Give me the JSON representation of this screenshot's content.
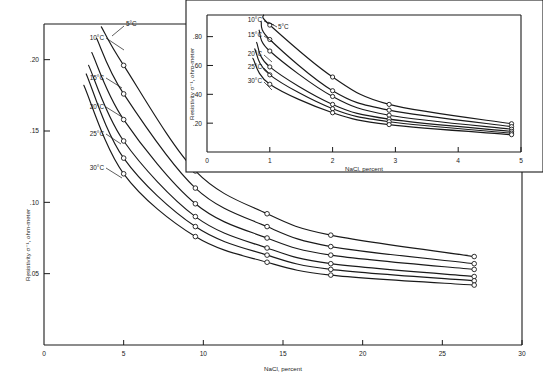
{
  "figure": {
    "background": "#ffffff",
    "ink_color": "#1a1a1a",
    "marker_style": "open-circle"
  },
  "chart_data": [
    {
      "id": "main",
      "type": "line",
      "title": "",
      "xlabel": "NaCl, percent",
      "ylabel": "Resistivity σ⁻¹, ohm-meter",
      "xlim": [
        0,
        30
      ],
      "ylim": [
        0,
        0.225
      ],
      "xticks": [
        0,
        5,
        10,
        15,
        20,
        25,
        30
      ],
      "xticklabels": [
        "0",
        "5",
        "10",
        "15",
        "20",
        "25",
        "30"
      ],
      "yticks": [
        0.05,
        0.1,
        0.15,
        0.2
      ],
      "yticklabels": [
        ".05",
        ".10",
        ".15",
        ".20"
      ],
      "grid": false,
      "legend_position": "inline-curve-labels",
      "x": [
        5,
        9.5,
        14,
        18,
        27
      ],
      "series": [
        {
          "name": "5°C",
          "label": "5°C",
          "values": [
            0.196,
            0.122,
            0.092,
            0.077,
            0.062
          ]
        },
        {
          "name": "10°C",
          "label": "10°C",
          "values": [
            0.176,
            0.11,
            0.083,
            0.069,
            0.057
          ]
        },
        {
          "name": "15°C",
          "label": "15°C",
          "values": [
            0.158,
            0.099,
            0.075,
            0.063,
            0.053
          ]
        },
        {
          "name": "20°C",
          "label": "20°C",
          "values": [
            0.143,
            0.09,
            0.068,
            0.057,
            0.048
          ]
        },
        {
          "name": "25°C",
          "label": "25°C",
          "values": [
            0.131,
            0.083,
            0.063,
            0.053,
            0.045
          ]
        },
        {
          "name": "30°C",
          "label": "30°C",
          "values": [
            0.12,
            0.076,
            0.058,
            0.049,
            0.042
          ]
        }
      ]
    },
    {
      "id": "inset",
      "type": "line",
      "title": "",
      "xlabel": "NaCl, percent",
      "ylabel": "Resistivity σ⁻¹, ohm-meter",
      "xlim": [
        0,
        5
      ],
      "ylim": [
        0,
        0.95
      ],
      "xticks": [
        0,
        1,
        2,
        3,
        4,
        5
      ],
      "xticklabels": [
        "0",
        "1",
        "2",
        "3",
        "4",
        "5"
      ],
      "yticks": [
        0.2,
        0.4,
        0.6,
        0.8
      ],
      "yticklabels": [
        ".20",
        ".40",
        ".60",
        ".80"
      ],
      "grid": false,
      "legend_position": "inline-curve-labels",
      "x": [
        1,
        2,
        2.9,
        4.85
      ],
      "series": [
        {
          "name": "5°C",
          "label": "5°C",
          "values": [
            0.88,
            0.52,
            0.33,
            0.196
          ]
        },
        {
          "name": "10°C",
          "label": "10°C",
          "values": [
            0.78,
            0.425,
            0.29,
            0.176
          ]
        },
        {
          "name": "15°C",
          "label": "15°C",
          "values": [
            0.7,
            0.385,
            0.255,
            0.158
          ]
        },
        {
          "name": "20°C",
          "label": "20°C",
          "values": [
            0.59,
            0.33,
            0.228,
            0.143
          ]
        },
        {
          "name": "25°C",
          "label": "25°C",
          "values": [
            0.535,
            0.3,
            0.21,
            0.131
          ]
        },
        {
          "name": "30°C",
          "label": "30°C",
          "values": [
            0.47,
            0.272,
            0.19,
            0.12
          ]
        }
      ]
    }
  ],
  "main_labels": {
    "xlabel": "NaCl, percent",
    "ylabel": "Resistivity σ⁻¹, ohm-meter",
    "curve_labels": [
      "5°C",
      "10°C",
      "15°C",
      "20°C",
      "25°C",
      "30°C"
    ],
    "xticklabels": [
      "0",
      "5",
      "10",
      "15",
      "20",
      "25",
      "30"
    ],
    "yticklabels": [
      ".05",
      ".10",
      ".15",
      ".20"
    ]
  },
  "inset_labels": {
    "xlabel": "NaCl, percent",
    "ylabel": "Resistivity σ⁻¹, ohm-meter",
    "curve_labels": [
      "5°C",
      "10°C",
      "15°C",
      "20°C",
      "25°C",
      "30°C"
    ],
    "xticklabels": [
      "0",
      "1",
      "2",
      "3",
      "4",
      "5"
    ],
    "yticklabels": [
      ".20",
      ".40",
      ".60",
      ".80"
    ]
  }
}
